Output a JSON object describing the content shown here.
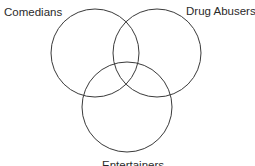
{
  "diagram": {
    "type": "venn",
    "sets": [
      {
        "id": "a",
        "label": "Comedians",
        "cx": 95,
        "cy": 53,
        "r": 44
      },
      {
        "id": "b",
        "label": "Drug Abusers",
        "cx": 157,
        "cy": 53,
        "r": 44
      },
      {
        "id": "c",
        "label": "Entertainers",
        "cx": 127,
        "cy": 107,
        "r": 45
      }
    ],
    "stroke_color": "#3a3a3a",
    "background": "#ffffff"
  }
}
